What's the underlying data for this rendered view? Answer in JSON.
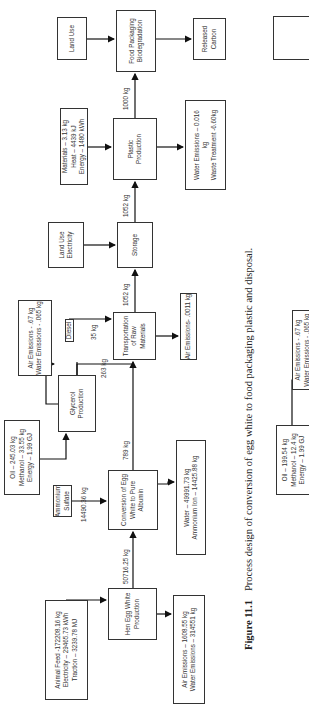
{
  "figure": {
    "number": "Figure 11.1",
    "caption": "Process design of conversion of egg white to food packaging plastic and disposal."
  },
  "nodes": {
    "animal_feed": [
      "Animal Feed -172208.16 kg",
      "Electricity – 29465.73 kWh",
      "Traction – 3239.78 MJ"
    ],
    "hen_egg": [
      "Hen Egg White",
      "Production"
    ],
    "hen_emissions": [
      "Air Emissions – 1608.55 kg",
      "Water Emissions – 314551 kg"
    ],
    "ammonium_sulfate": [
      "Ammonium",
      "Sulfate"
    ],
    "conversion": [
      "Conversion of Egg",
      "White to Pure",
      "Albumin"
    ],
    "conversion_waste": [
      "Water – 49991.73 kg",
      "Ammonium Ion – 14425.88 kg"
    ],
    "oil_inputs": [
      "Oil – 245.03 kg",
      "Methanol – 33.55 kg",
      "Energy – 1.99 GJ"
    ],
    "glycerol": [
      "Glycerol",
      "Production"
    ],
    "glycerol_emissions": [
      "Air Emissions - .67 kg",
      "Water Emissions - .065 kg"
    ],
    "diesel": [
      "Diesel"
    ],
    "transport": [
      "Transportation",
      "of Raw",
      "Materials"
    ],
    "transport_emissions": [
      "Air Emissions- .0011 kg"
    ],
    "landuse_electricity": [
      "Land Use",
      "Electricity"
    ],
    "storage": [
      "Storage"
    ],
    "materials": [
      "Materials – 3.13 kg",
      "Heat – 4439 kJ",
      "Energy – 1480 kWh"
    ],
    "plastic": [
      "Plastic",
      "Production"
    ],
    "plastic_waste": [
      "Water Emissions – 0.016",
      "kg",
      "Waste Treatment -6.60kg"
    ],
    "land_use": [
      "Land Use"
    ],
    "biodegradation": [
      "Food Packaging",
      "Biodegradation"
    ],
    "released_carbon": [
      "Released",
      "Carbon"
    ],
    "next_oil_inputs": [
      "Oil – 199.54 kg",
      "Methanol – 12.4 kg",
      "Energy – 1.99 GJ"
    ],
    "next_glycerol_emissions": [
      "Air Emissions - .67 kg",
      "Water Emissions - .065 kg"
    ]
  },
  "flows": {
    "egg_white_out": "50716.25 kg",
    "ammonium_sulfate_in": "14490.36 kg",
    "albumin_out": "789 kg",
    "glycerol_out": "263 kg",
    "diesel_in": "35 kg",
    "transport_out": "1052 kg",
    "storage_out": "1052 kg",
    "plastic_out": "1000 kg"
  }
}
